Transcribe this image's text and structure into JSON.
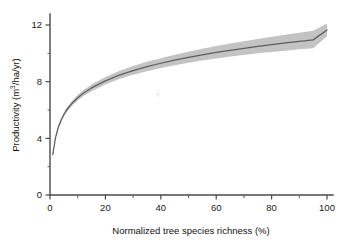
{
  "chart_data": {
    "type": "line",
    "title": "",
    "xlabel": "Normalized tree species richness (%)",
    "ylabel": "Productivity (m³/ha/yr)",
    "ylabel_parts": {
      "prefix": "Productivity (m",
      "superscript": "3",
      "suffix": "/ha/yr)"
    },
    "xlim": [
      0,
      100
    ],
    "ylim": [
      0,
      13.2
    ],
    "grid": false,
    "legend": null,
    "x_ticks_major": [
      0,
      20,
      40,
      60,
      80,
      100
    ],
    "x_tick_labels": [
      "0",
      "20",
      "40",
      "60",
      "80",
      "100"
    ],
    "x_ticks_minor": [
      10,
      30,
      50,
      70,
      90
    ],
    "y_ticks_major": [
      0,
      4,
      8,
      12
    ],
    "y_tick_labels": [
      "0",
      "4",
      "8",
      "12"
    ],
    "y_ticks_minor": [
      2,
      6,
      10
    ],
    "series": [
      {
        "name": "Fitted productivity",
        "color": "#5e5e5e",
        "x": [
          1,
          2,
          3,
          4,
          5,
          6,
          8,
          10,
          12,
          15,
          20,
          25,
          30,
          35,
          40,
          45,
          50,
          55,
          60,
          65,
          70,
          75,
          80,
          85,
          90,
          95,
          100
        ],
        "values": [
          2.85,
          4.05,
          4.78,
          5.28,
          5.68,
          6.0,
          6.48,
          6.86,
          7.18,
          7.56,
          8.06,
          8.46,
          8.78,
          9.06,
          9.3,
          9.52,
          9.71,
          9.89,
          10.06,
          10.21,
          10.35,
          10.49,
          10.61,
          10.73,
          10.85,
          10.95,
          11.65
        ]
      }
    ],
    "confidence_band": {
      "name": "95% confidence interval",
      "color": "#b6b6b6",
      "x": [
        1,
        2,
        3,
        4,
        5,
        6,
        8,
        10,
        12,
        15,
        20,
        25,
        30,
        35,
        40,
        45,
        50,
        55,
        60,
        65,
        70,
        75,
        80,
        85,
        90,
        95,
        100
      ],
      "lower": [
        2.82,
        3.99,
        4.68,
        5.16,
        5.54,
        5.85,
        6.31,
        6.67,
        6.97,
        7.33,
        7.8,
        8.18,
        8.48,
        8.74,
        8.96,
        9.16,
        9.33,
        9.49,
        9.64,
        9.77,
        9.89,
        10.0,
        10.1,
        10.19,
        10.28,
        10.36,
        11.2
      ],
      "upper": [
        2.88,
        4.12,
        4.88,
        5.4,
        5.82,
        6.16,
        6.66,
        7.06,
        7.4,
        7.8,
        8.33,
        8.75,
        9.1,
        9.4,
        9.66,
        9.9,
        10.12,
        10.32,
        10.51,
        10.69,
        10.86,
        11.02,
        11.17,
        11.32,
        11.46,
        11.59,
        12.1
      ]
    }
  },
  "axes": {
    "x_axis_title": "Normalized tree species richness (%)",
    "y_axis_title": "Productivity (m³/ha/yr)"
  }
}
